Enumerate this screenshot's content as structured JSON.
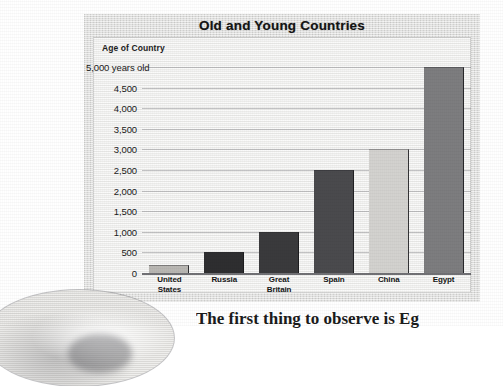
{
  "chart_data": {
    "type": "bar",
    "title": "Old and Young Countries",
    "ylabel": "Age of Country",
    "xlabel": "",
    "categories": [
      "United States",
      "Russia",
      "Great Britain",
      "Spain",
      "China",
      "Egypt"
    ],
    "category_lines": [
      [
        "United",
        "States"
      ],
      [
        "Russia"
      ],
      [
        "Great",
        "Britain"
      ],
      [
        "Spain"
      ],
      [
        "China"
      ],
      [
        "Egypt"
      ]
    ],
    "values": [
      200,
      500,
      1000,
      2500,
      3000,
      5000
    ],
    "bar_colors": [
      "#b9b7b3",
      "#2e2e30",
      "#3a3a3c",
      "#4a4a4d",
      "#d3d2cf",
      "#7d7d7f"
    ],
    "ylim": [
      0,
      5000
    ],
    "ytick_values": [
      5000,
      4500,
      4000,
      3500,
      3000,
      2500,
      2000,
      1500,
      1000,
      500,
      0
    ],
    "ytick_labels": [
      "5,000 years old",
      "4,500",
      "4,000",
      "3,500",
      "3,000",
      "2,500",
      "2,000",
      "1,500",
      "1,000",
      "500",
      "0"
    ],
    "units": "years old",
    "grid": true,
    "legend": false
  },
  "page": {
    "body_text": "The first thing to observe is Eg",
    "photo_caption": ""
  }
}
